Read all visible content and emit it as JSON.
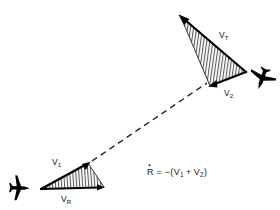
{
  "figure": {
    "background_color": "#ffffff",
    "stroke_color": "#000000",
    "hatch_color": "#2b2b2b",
    "dashed_color": "#1a1a1a"
  },
  "labels": {
    "v_t": {
      "base": "V",
      "sub": "T",
      "full": "V_T"
    },
    "v_2": {
      "base": "V",
      "sub": "2",
      "full": "V_2"
    },
    "v_1": {
      "base": "V",
      "sub": "1",
      "full": "V_1"
    },
    "v_r": {
      "base": "V",
      "sub": "R",
      "full": "V_R"
    }
  },
  "equation": {
    "lhs": "R",
    "lhs_accent": "̇",
    "relation": "=",
    "rhs_prefix": "−(",
    "rhs_term1_base": "V",
    "rhs_term1_sub": "1",
    "rhs_operator": "+",
    "rhs_term2_base": "V",
    "rhs_term2_sub": "2",
    "rhs_suffix": ")",
    "full": "Ṙ = −(V₁ + V₂)"
  },
  "aircraft": {
    "target_name": "target-aircraft",
    "interceptor_name": "interceptor-aircraft"
  },
  "line_of_sight": {
    "name": "line-of-sight",
    "style": "dashed"
  }
}
